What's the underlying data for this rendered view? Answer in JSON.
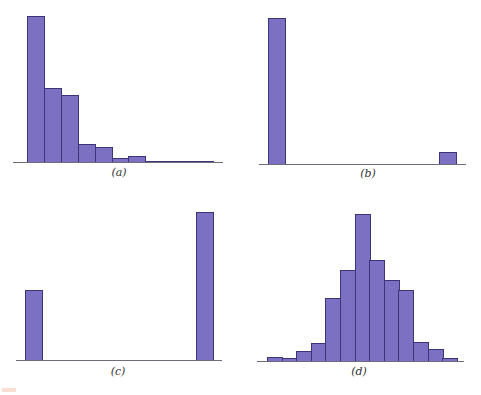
{
  "chart_data": [
    {
      "type": "bar",
      "panel_label": "(a)",
      "description": "Right-skewed histogram",
      "categories": [
        "1",
        "2",
        "3",
        "4",
        "5",
        "6",
        "7",
        "8",
        "9",
        "10",
        "11"
      ],
      "values": [
        100,
        51,
        46,
        12,
        10,
        3,
        4,
        0.5,
        0.5,
        0.5,
        0.5
      ],
      "title": "",
      "xlabel": "",
      "ylabel": "",
      "grid": false,
      "legend": null,
      "layout": {
        "left": 27,
        "baseline": 162,
        "bar_width": 16.9,
        "max_height": 146,
        "axis_left": 13,
        "axis_right": 223
      }
    },
    {
      "type": "bar",
      "panel_label": "(b)",
      "description": "Two separated bars: large at left, small at right",
      "categories": [
        "left",
        "right"
      ],
      "values": [
        100,
        8
      ],
      "positions_px": [
        268,
        439
      ],
      "title": "",
      "xlabel": "",
      "ylabel": "",
      "grid": false,
      "legend": null,
      "layout": {
        "baseline": 164,
        "bar_width": 17,
        "max_height": 146,
        "axis_left": 259,
        "axis_right": 466
      }
    },
    {
      "type": "bar",
      "panel_label": "(c)",
      "description": "Two separated bars: medium at left, tall at right",
      "categories": [
        "left",
        "right"
      ],
      "values": [
        47,
        100
      ],
      "positions_px": [
        25,
        196
      ],
      "title": "",
      "xlabel": "",
      "ylabel": "",
      "grid": false,
      "legend": null,
      "layout": {
        "baseline": 360,
        "bar_width": 17,
        "max_height": 148,
        "axis_left": 16,
        "axis_right": 222
      }
    },
    {
      "type": "bar",
      "panel_label": "(d)",
      "description": "Roughly symmetric bell-shaped histogram",
      "categories": [
        "1",
        "2",
        "3",
        "4",
        "5",
        "6",
        "7",
        "8",
        "9",
        "10",
        "11",
        "12",
        "13"
      ],
      "values": [
        3,
        2,
        7,
        12,
        43,
        62,
        100,
        69,
        55,
        48,
        13,
        8,
        2
      ],
      "title": "",
      "xlabel": "",
      "ylabel": "",
      "grid": false,
      "legend": null,
      "layout": {
        "left": 267,
        "baseline": 361,
        "bar_width": 14.6,
        "max_height": 147,
        "axis_left": 257,
        "axis_right": 464
      }
    }
  ],
  "captions": {
    "a": "(a)",
    "b": "(b)",
    "c": "(c)",
    "d": "(d)"
  },
  "colors": {
    "bar_fill": "#7b70c2",
    "bar_edge": "#3b3478",
    "axis": "#6e6e7a",
    "caption": "#333333"
  }
}
